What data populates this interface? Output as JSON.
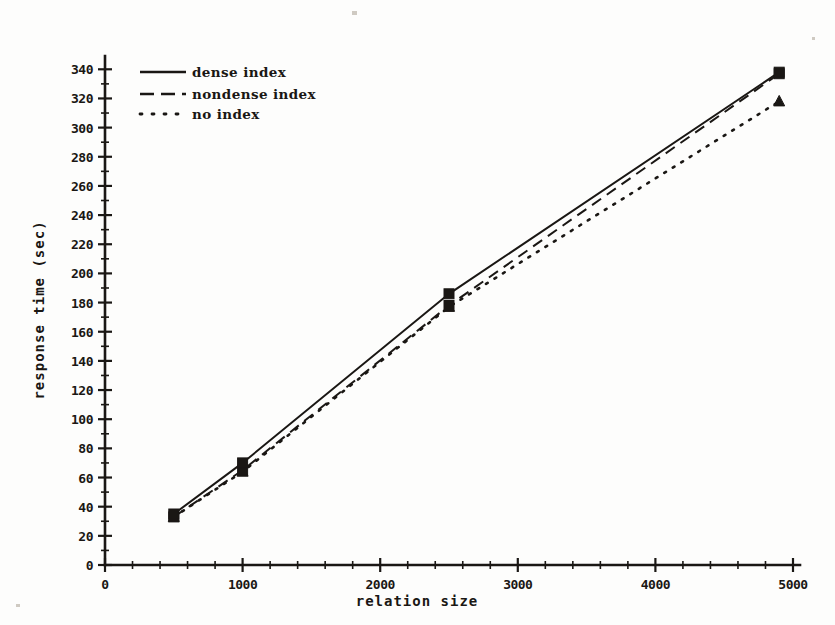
{
  "chart_data": {
    "type": "line",
    "title": "",
    "xlabel": "relation size",
    "ylabel": "response time (sec)",
    "xlim": [
      0,
      5000
    ],
    "ylim": [
      0,
      345
    ],
    "grid": false,
    "legend_position": "top-left inside axes",
    "x_ticks": [
      0,
      1000,
      2000,
      3000,
      4000,
      5000
    ],
    "x_tick_labels": [
      "0",
      "1000",
      "2000",
      "3000",
      "4000",
      "5000"
    ],
    "x_minor_step": 200,
    "y_ticks": [
      0,
      20,
      40,
      60,
      80,
      100,
      120,
      140,
      160,
      180,
      200,
      220,
      240,
      260,
      280,
      300,
      320,
      340
    ],
    "y_tick_labels": [
      "0",
      "20",
      "40",
      "60",
      "80",
      "100",
      "120",
      "140",
      "160",
      "180",
      "200",
      "220",
      "240",
      "260",
      "280",
      "300",
      "320",
      "340"
    ],
    "y_minor_step": 10,
    "x": [
      500,
      1000,
      2500,
      4900
    ],
    "series": [
      {
        "name": "dense index",
        "style": "solid",
        "marker": "square",
        "values": [
          35,
          70,
          186,
          338
        ]
      },
      {
        "name": "nondense index",
        "style": "dashed",
        "marker": "square",
        "values": [
          33,
          65,
          178,
          337
        ]
      },
      {
        "name": "no index",
        "style": "dotted",
        "marker": "triangle",
        "values": [
          33,
          64,
          177,
          318
        ]
      }
    ]
  },
  "legend": {
    "items": [
      {
        "label": "dense index",
        "style": "solid"
      },
      {
        "label": "nondense index",
        "style": "dashed"
      },
      {
        "label": "no index",
        "style": "dotted"
      }
    ]
  },
  "axes": {
    "x_title": "relation size",
    "y_title": "response time (sec)"
  },
  "colors": {
    "ink": "#1a1714",
    "paper": "#fdfdfc"
  }
}
